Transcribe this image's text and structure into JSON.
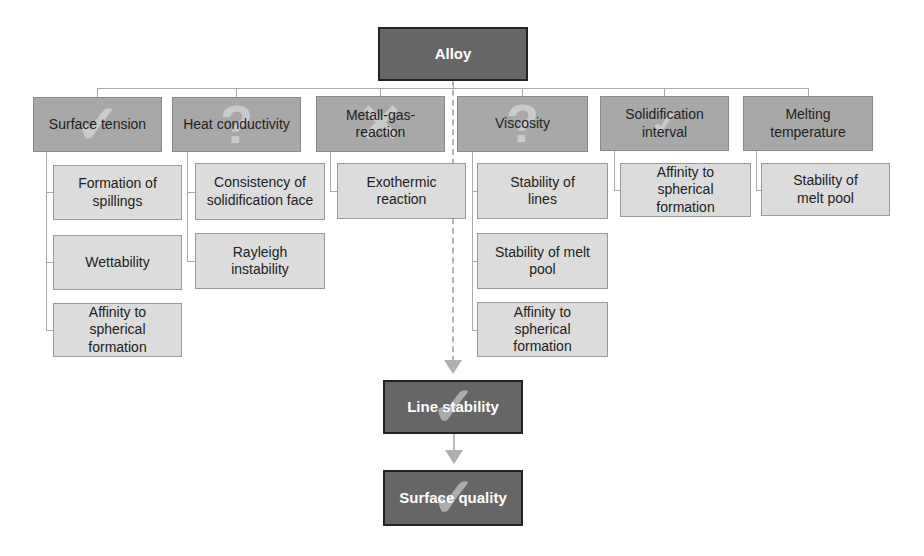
{
  "root": {
    "label": "Alloy"
  },
  "categories": [
    {
      "label": "Surface tension",
      "mark": "check",
      "children": [
        "Formation of spillings",
        "Wettability",
        "Affinity to spherical formation"
      ]
    },
    {
      "label": "Heat conductivity",
      "mark": "question",
      "children": [
        "Consistency of solidification face",
        "Rayleigh instability"
      ]
    },
    {
      "label": "Metall-gas-reaction",
      "mark": "cross",
      "children": [
        "Exothermic reaction"
      ]
    },
    {
      "label": "Viscosity",
      "mark": "question",
      "children": [
        "Stability of lines",
        "Stability of melt pool",
        "Affinity to spherical formation"
      ]
    },
    {
      "label": "Solidification interval",
      "mark": "check",
      "children": [
        "Affinity to spherical formation"
      ]
    },
    {
      "label": "Melting temperature",
      "mark": "none",
      "children": [
        "Stability of melt pool"
      ]
    }
  ],
  "outcomes": [
    {
      "label": "Line stability",
      "mark": "check"
    },
    {
      "label": "Surface quality",
      "mark": "check"
    }
  ],
  "marks": {
    "check": "✓",
    "question": "?",
    "cross": "✕"
  },
  "colors": {
    "root_fill": "#666666",
    "category_fill": "#a8a8a8",
    "child_fill": "#dcdcdc",
    "connector": "#aaaaaa"
  }
}
